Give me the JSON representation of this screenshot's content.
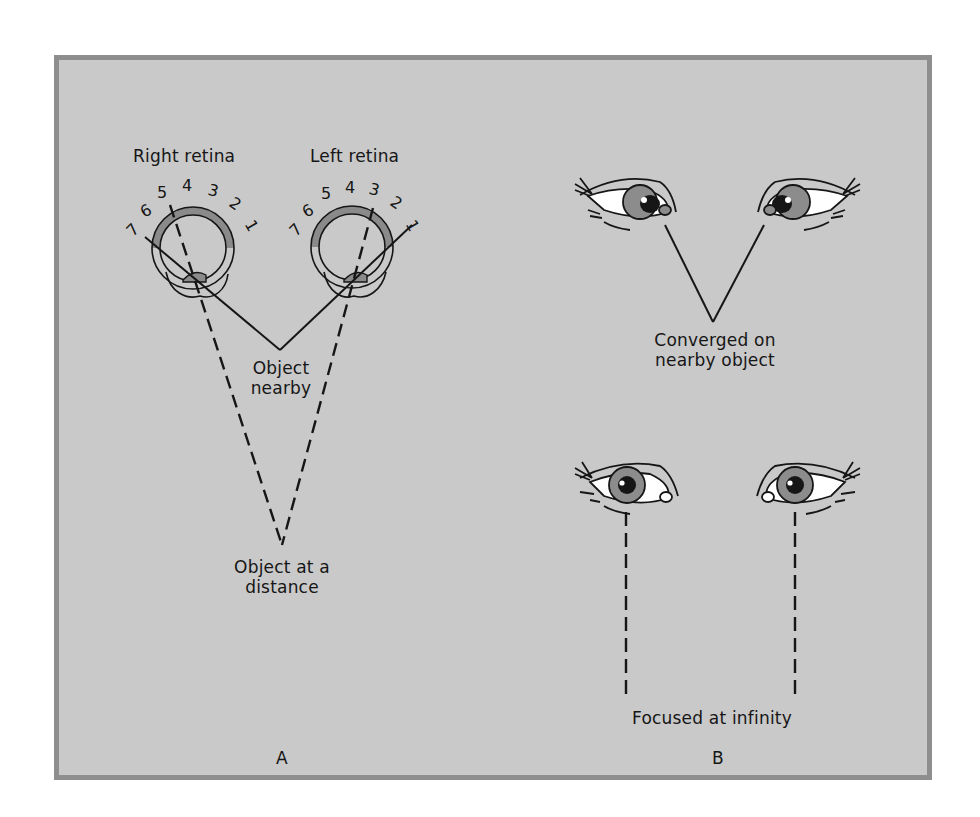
{
  "figure": {
    "panels": [
      {
        "id": "A",
        "label": "A",
        "retina_titles": {
          "right": "Right retina",
          "left": "Left retina"
        },
        "retina_numbers_right": [
          "7",
          "6",
          "5",
          "4",
          "3",
          "2",
          "1"
        ],
        "retina_numbers_left": [
          "7",
          "6",
          "5",
          "4",
          "3",
          "2",
          "1"
        ],
        "object_nearby_label": [
          "Object",
          "nearby"
        ],
        "object_distance_label": [
          "Object at a",
          "distance"
        ]
      },
      {
        "id": "B",
        "label": "B",
        "converged_label": [
          "Converged on",
          "nearby object"
        ],
        "infinity_label": "Focused at infinity"
      }
    ],
    "colors": {
      "background": "#c9c9c9",
      "frame_border": "#8e8e8e",
      "ink": "#161616",
      "retina_band": "#8a8a8a",
      "iris": "#8c8c8c",
      "sclera": "#ffffff"
    }
  }
}
